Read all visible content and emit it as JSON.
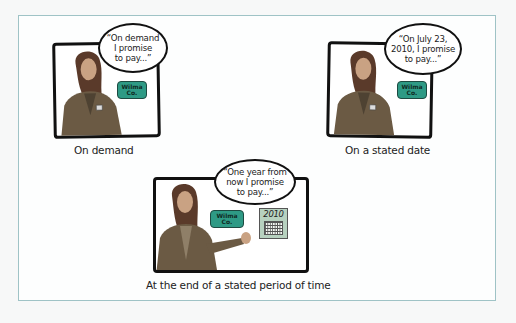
{
  "figure": {
    "panels": [
      {
        "id": "on-demand",
        "speech": "“On demand\nI promise\nto pay...”",
        "badge": "Wilma\nCo.",
        "caption": "On demand"
      },
      {
        "id": "stated-date",
        "speech": "“On July 23,\n2010, I promise\nto pay...”",
        "badge": "Wilma\nCo.",
        "caption": "On a stated date"
      },
      {
        "id": "stated-period",
        "speech": "“One year from\nnow I promise\nto pay...”",
        "badge": "Wilma\nCo.",
        "calendar_year": "2010",
        "caption": "At the end of a stated period of time"
      }
    ],
    "colors": {
      "outer_border": "#9fc3c6",
      "badge": "#2e9a85",
      "calendar": "#b7d1bf",
      "suit": "#6b5a44",
      "hair": "#5a3a2a"
    }
  }
}
